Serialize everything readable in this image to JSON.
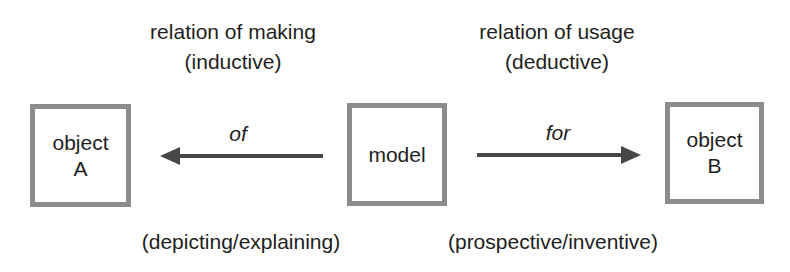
{
  "diagram": {
    "type": "model-relation-diagram",
    "colors": {
      "box_border": "#8c8c8c",
      "arrow": "#474747",
      "text": "#1e1e1e",
      "background": "#ffffff"
    },
    "nodes": [
      {
        "id": "objectA",
        "line1": "object",
        "line2": "A"
      },
      {
        "id": "model",
        "label": "model"
      },
      {
        "id": "objectB",
        "line1": "object",
        "line2": "B"
      }
    ],
    "left_relation": {
      "title": "relation of making",
      "subtitle": "(inductive)",
      "arrow_label": "of",
      "bottom_label": "(depicting/explaining)",
      "direction": "model -> object A"
    },
    "right_relation": {
      "title": "relation of usage",
      "subtitle": "(deductive)",
      "arrow_label": "for",
      "bottom_label": "(prospective/inventive)",
      "direction": "model -> object B"
    }
  }
}
